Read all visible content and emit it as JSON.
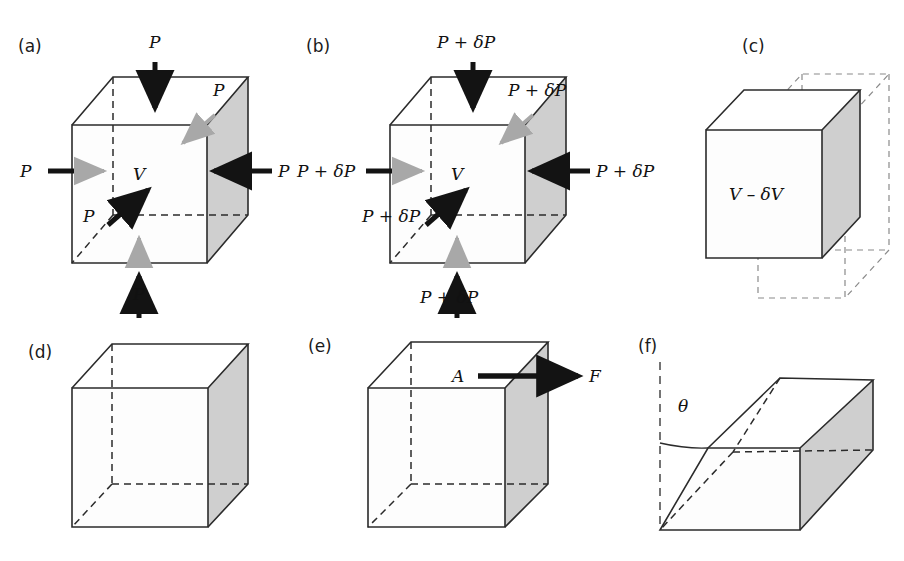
{
  "figure": {
    "width": 904,
    "height": 561,
    "background": "#ffffff",
    "colors": {
      "edge": "#2b2b2b",
      "shaded_face": "#cfcfcf",
      "front_face": "#fdfdfd",
      "arrow_black": "#131313",
      "arrow_grey": "#a8a8a8",
      "ghost_edge": "#8a8a8a",
      "text": "#111111"
    }
  },
  "panels": [
    {
      "id": "a",
      "label": "(a)",
      "volume_label": "V",
      "pressure_label": "P",
      "arrows": [
        {
          "name": "top-pressure-arrow",
          "label": "P",
          "direction": "down"
        },
        {
          "name": "bottom-pressure-arrow",
          "label": "P",
          "direction": "up"
        },
        {
          "name": "left-pressure-arrow",
          "label": "P",
          "direction": "right"
        },
        {
          "name": "right-pressure-arrow",
          "label": "P",
          "direction": "left"
        },
        {
          "name": "front-pressure-arrow",
          "label": "P",
          "direction": "into-page"
        },
        {
          "name": "back-pressure-arrow",
          "label": "P",
          "direction": "out-of-page"
        }
      ]
    },
    {
      "id": "b",
      "label": "(b)",
      "volume_label": "V",
      "pressure_label": "P + δP",
      "arrows": [
        {
          "name": "top-pressure-arrow",
          "label": "P + δP",
          "direction": "down"
        },
        {
          "name": "bottom-pressure-arrow",
          "label": "P + δP",
          "direction": "up"
        },
        {
          "name": "left-pressure-arrow",
          "label": "P + δP",
          "direction": "right"
        },
        {
          "name": "right-pressure-arrow",
          "label": "P + δP",
          "direction": "left"
        },
        {
          "name": "front-pressure-arrow",
          "label": "P + δP",
          "direction": "into-page"
        },
        {
          "name": "back-pressure-arrow",
          "label": "P + δP",
          "direction": "out-of-page"
        }
      ]
    },
    {
      "id": "c",
      "label": "(c)",
      "volume_label": "V – δV",
      "note": "compressed cube drawn inside dashed original-volume outline"
    },
    {
      "id": "d",
      "label": "(d)",
      "note": "undeformed reference cube"
    },
    {
      "id": "e",
      "label": "(e)",
      "area_label": "A",
      "force_label": "F",
      "note": "tangential force F applied over top area A"
    },
    {
      "id": "f",
      "label": "(f)",
      "angle_label": "θ",
      "note": "sheared cube, shear angle theta from vertical"
    }
  ]
}
